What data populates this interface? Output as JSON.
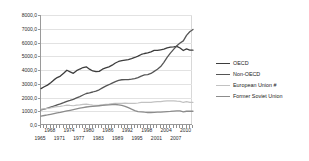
{
  "chart_data": {
    "type": "line",
    "title": "",
    "xlabel": "",
    "ylabel": "",
    "ylim": [
      0,
      8000
    ],
    "xlim": [
      1965,
      2012
    ],
    "grid": true,
    "legend_position": "right",
    "y_ticks": [
      "0,0",
      "1000,0",
      "2000,0",
      "3000,0",
      "4000,0",
      "5000,0",
      "6000,0",
      "7000,0",
      "8000,0"
    ],
    "y_tick_values": [
      0,
      1000,
      2000,
      3000,
      4000,
      5000,
      6000,
      7000,
      8000
    ],
    "x_labels_top_row": [
      "1968",
      "1974",
      "1980",
      "1986",
      "1992",
      "1998",
      "2004",
      "2010"
    ],
    "x_labels_bottom_row": [
      "1965",
      "1971",
      "1977",
      "1983",
      "1989",
      "1995",
      "2001",
      "2007"
    ],
    "x": [
      1965,
      1966,
      1967,
      1968,
      1969,
      1970,
      1971,
      1972,
      1973,
      1974,
      1975,
      1976,
      1977,
      1978,
      1979,
      1980,
      1981,
      1982,
      1983,
      1984,
      1985,
      1986,
      1987,
      1988,
      1989,
      1990,
      1991,
      1992,
      1993,
      1994,
      1995,
      1996,
      1997,
      1998,
      1999,
      2000,
      2001,
      2002,
      2003,
      2004,
      2005,
      2006,
      2007,
      2008,
      2009,
      2010,
      2011,
      2012
    ],
    "series": [
      {
        "name": "OECD",
        "color": "#3d3d3d",
        "width": 1.3,
        "values": [
          2650,
          2780,
          2900,
          3080,
          3280,
          3450,
          3560,
          3760,
          3980,
          3870,
          3760,
          3950,
          4070,
          4180,
          4230,
          4060,
          3930,
          3880,
          3900,
          4060,
          4150,
          4230,
          4350,
          4510,
          4620,
          4680,
          4720,
          4760,
          4830,
          4910,
          5010,
          5130,
          5200,
          5250,
          5320,
          5430,
          5420,
          5470,
          5520,
          5610,
          5660,
          5680,
          5720,
          5600,
          5420,
          5530,
          5450,
          5440
        ]
      },
      {
        "name": "Non-OECD",
        "color": "#555555",
        "width": 1.3,
        "values": [
          1100,
          1160,
          1220,
          1300,
          1380,
          1460,
          1530,
          1620,
          1720,
          1790,
          1870,
          1970,
          2070,
          2180,
          2290,
          2340,
          2400,
          2470,
          2560,
          2700,
          2830,
          2930,
          3050,
          3160,
          3250,
          3290,
          3300,
          3300,
          3330,
          3370,
          3450,
          3560,
          3640,
          3670,
          3750,
          3900,
          4050,
          4250,
          4560,
          4920,
          5230,
          5500,
          5760,
          5960,
          6120,
          6520,
          6780,
          6950
        ]
      },
      {
        "name": "European Union #",
        "color": "#c2c2c2",
        "width": 1.2,
        "values": [
          1150,
          1180,
          1210,
          1250,
          1300,
          1340,
          1360,
          1400,
          1450,
          1420,
          1400,
          1450,
          1460,
          1500,
          1520,
          1480,
          1450,
          1430,
          1440,
          1470,
          1500,
          1520,
          1550,
          1580,
          1580,
          1570,
          1590,
          1570,
          1570,
          1570,
          1600,
          1640,
          1640,
          1650,
          1650,
          1680,
          1700,
          1700,
          1730,
          1750,
          1760,
          1760,
          1730,
          1720,
          1640,
          1700,
          1640,
          1650
        ]
      },
      {
        "name": "Former Soviet Union",
        "color": "#8c8c8c",
        "width": 1.3,
        "values": [
          650,
          690,
          730,
          780,
          830,
          880,
          920,
          970,
          1020,
          1070,
          1120,
          1170,
          1220,
          1270,
          1310,
          1340,
          1360,
          1380,
          1400,
          1420,
          1440,
          1460,
          1480,
          1490,
          1470,
          1430,
          1360,
          1260,
          1150,
          1050,
          980,
          960,
          930,
          910,
          910,
          920,
          930,
          930,
          960,
          980,
          990,
          1010,
          1020,
          1020,
          960,
          1000,
          1000,
          1000
        ]
      }
    ]
  },
  "legend": {
    "items": [
      {
        "label": "OECD"
      },
      {
        "label": "Non-OECD"
      },
      {
        "label": "European Union #"
      },
      {
        "label": "Former Soviet Union"
      }
    ]
  }
}
